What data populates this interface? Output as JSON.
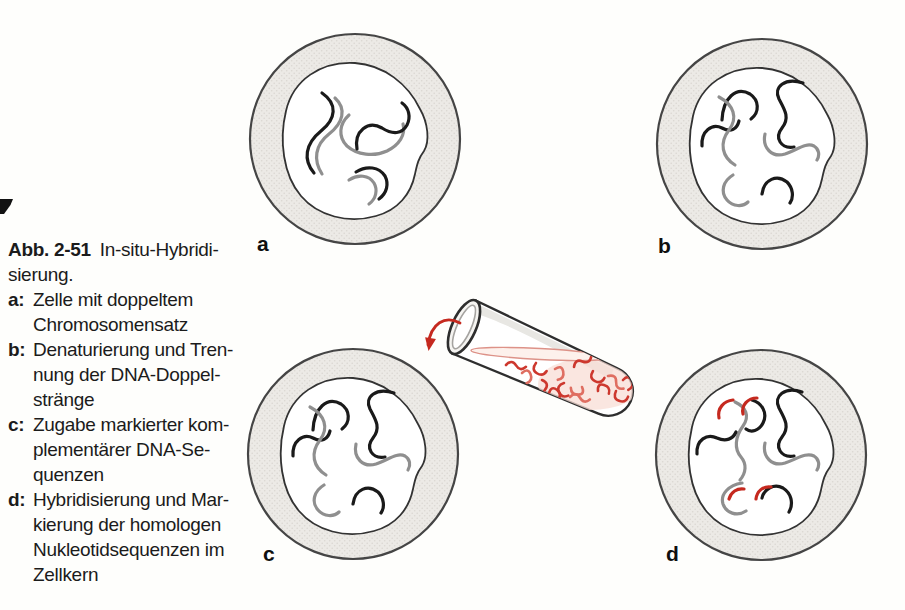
{
  "caption": {
    "figure_label": "Abb. 2-51",
    "title": "In-situ-Hybridi-\nsierung.",
    "items": [
      {
        "label": "a:",
        "text": "Zelle mit doppeltem\nChromosomensatz"
      },
      {
        "label": "b:",
        "text": "Denaturierung und Tren-\nnung der DNA-Doppel-\nstränge"
      },
      {
        "label": "c:",
        "text": "Zugabe markierter kom-\nplementärer DNA-Se-\nquenzen"
      },
      {
        "label": "d:",
        "text": "Hybridisierung und Mar-\nkierung der homologen\nNukleotidsequenzen im\nZellkern"
      }
    ]
  },
  "diagram": {
    "panel_labels": {
      "a": "a",
      "b": "b",
      "c": "c",
      "d": "d"
    },
    "colors": {
      "strand_dark": "#1a1a1a",
      "strand_light": "#8f8f8f",
      "probe_red": "#c5291f",
      "probe_red_light": "#df6e61",
      "cytoplasm_fill": "#e9e8e4",
      "cell_outline": "#3f3f3f",
      "liquid_surface_outline": "#dd9288",
      "background": "#fefefc"
    }
  }
}
